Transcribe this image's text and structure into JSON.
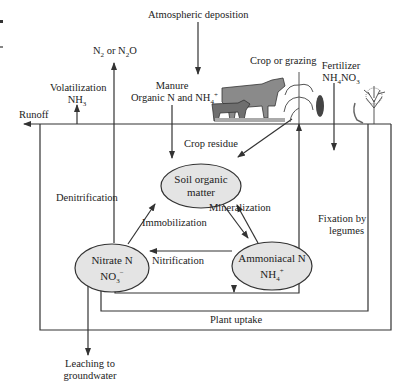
{
  "diagram": {
    "sources": {
      "atmospheric_deposition": "Atmospheric deposition",
      "n2_or_n2o": "N2 or N2O",
      "volatilization_line1": "Volatilization",
      "volatilization_line2": "NH3",
      "runoff": "Runoff",
      "manure_line1": "Manure",
      "manure_line2": "Organic N and NH4+",
      "crop_or_grazing": "Crop or grazing",
      "fertilizer_line1": "Fertilizer",
      "fertilizer_line2": "NH4NO3"
    },
    "processes": {
      "crop_residue": "Crop residue",
      "denitrification": "Denitrification",
      "mineralization": "Mineralization",
      "immobilization": "Immobilization",
      "nitrification": "Nitrification",
      "fixation_line1": "Fixation by",
      "fixation_line2": "legumes",
      "plant_uptake": "Plant uptake",
      "leaching_line1": "Leaching to",
      "leaching_line2": "groundwater"
    },
    "nodes": {
      "soil_organic_matter_line1": "Soil organic",
      "soil_organic_matter_line2": "matter",
      "nitrate_line1": "Nitrate N",
      "nitrate_line2": "NO3-",
      "ammoniacal_line1": "Ammoniacal N",
      "ammoniacal_line2": "NH4+"
    },
    "illustrations": [
      "cows-icon",
      "corn-plant-icon",
      "corn-ear-icon",
      "legume-plant-icon",
      "tree-icon"
    ],
    "colors": {
      "node_fill": "#e4e4e4",
      "line": "#333333",
      "background": "#ffffff"
    }
  }
}
